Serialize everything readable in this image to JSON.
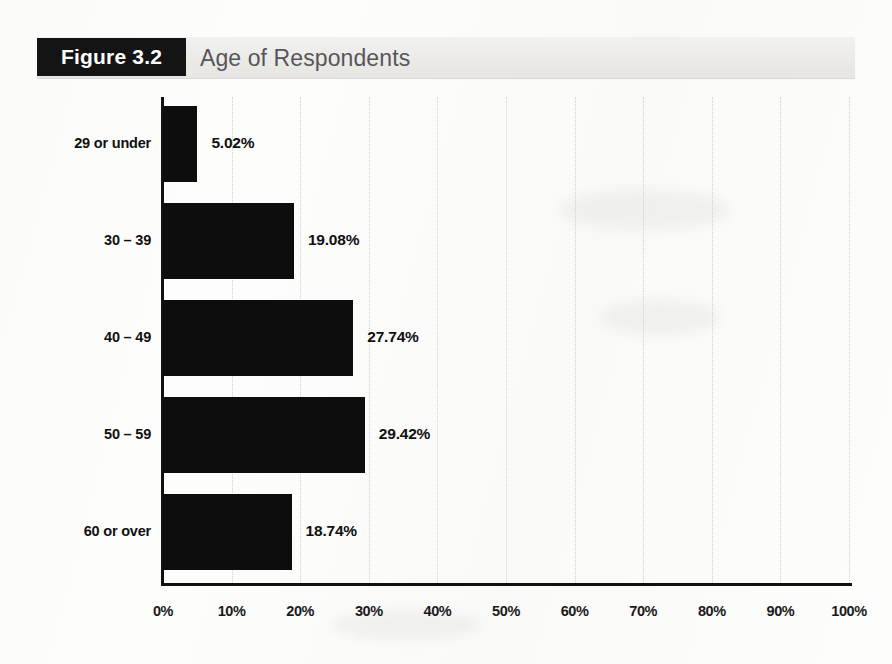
{
  "figure": {
    "tag": "Figure 3.2",
    "title": "Age of Respondents"
  },
  "chart_data": {
    "type": "bar",
    "orientation": "horizontal",
    "title": "Age of Respondents",
    "xlabel": "",
    "ylabel": "",
    "xlim": [
      0,
      100
    ],
    "grid": true,
    "legend": "none",
    "categories": [
      "29 or under",
      "30 – 39",
      "40 – 49",
      "50 – 59",
      "60 or over"
    ],
    "values": [
      5.02,
      19.08,
      27.74,
      29.42,
      18.74
    ],
    "value_labels": [
      "5.02%",
      "19.08%",
      "27.74%",
      "29.42%",
      "18.74%"
    ],
    "xticks": [
      0,
      10,
      20,
      30,
      40,
      50,
      60,
      70,
      80,
      90,
      100
    ],
    "xtick_labels": [
      "0%",
      "10%",
      "20%",
      "30%",
      "40%",
      "50%",
      "60%",
      "70%",
      "80%",
      "90%",
      "100%"
    ],
    "bar_color": "#0d0d0d",
    "axis_color": "#111111",
    "grid_color": "#d2d0cc"
  },
  "colors": {
    "tag_background": "#141414",
    "tag_text": "#ffffff",
    "title_text": "#55565a",
    "header_band": "#eceae7",
    "page_background": "#fdfdfc"
  }
}
